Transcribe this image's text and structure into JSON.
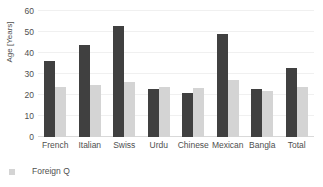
{
  "chart_data": {
    "type": "bar",
    "title": "",
    "subtitle": "",
    "xlabel": "",
    "ylabel": "Age [Years]",
    "ylim": [
      0,
      60
    ],
    "yticks": [
      0,
      10,
      20,
      30,
      40,
      50,
      60
    ],
    "ytick_labels": [
      "0",
      "10",
      "20",
      "30",
      "40",
      "50",
      "60"
    ],
    "grid": true,
    "grid_axis": "y",
    "legend_position": "bottom-left",
    "categories": [
      "French",
      "Italian",
      "Swiss",
      "Urdu",
      "Chinese",
      "Mexican",
      "Bangla",
      "Total"
    ],
    "series": [
      {
        "name": "",
        "color": "#404040",
        "values": [
          36,
          44,
          53,
          23,
          21,
          49,
          23,
          33
        ]
      },
      {
        "name": "Foreign Q",
        "color": "#d4d4d4",
        "values": [
          24,
          25,
          26,
          24,
          23.5,
          27,
          22,
          24
        ]
      }
    ],
    "legend_entries": [
      {
        "label": "Foreign Q",
        "color": "#d4d4d4",
        "marker": "square"
      }
    ]
  },
  "colors": {
    "background": "#ffffff",
    "series_primary": "#404040",
    "series_secondary": "#d4d4d4",
    "gridline": "#f0f0f0",
    "axis_line": "#d9d9d9",
    "text": "#4f4f4f"
  }
}
